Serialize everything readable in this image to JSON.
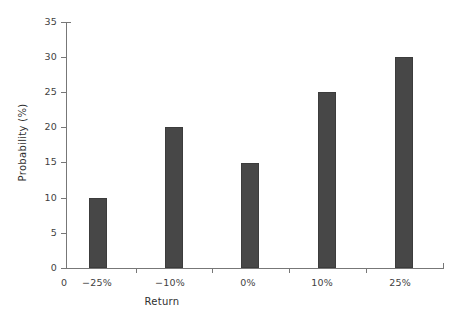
{
  "chart_data": {
    "type": "bar",
    "title": "",
    "subtitle": "",
    "xlabel": "Return",
    "ylabel": "Probability (%)",
    "categories": [
      "−25%",
      "−10%",
      "0%",
      "10%",
      "25%"
    ],
    "values": [
      10,
      20,
      15,
      25,
      30
    ],
    "series": [
      {
        "name": "Probability",
        "values": [
          10,
          20,
          15,
          25,
          30
        ]
      }
    ],
    "xlim_labels": [
      "0"
    ],
    "ylim": [
      0,
      35
    ],
    "ytick_labels": [
      "0",
      "5",
      "10",
      "15",
      "20",
      "25",
      "30",
      "35"
    ],
    "ytick_values": [
      0,
      5,
      10,
      15,
      20,
      25,
      30,
      35
    ],
    "xtick_labels": [
      "−25%",
      "−10%",
      "0%",
      "10%",
      "25%"
    ],
    "origin_label": "0",
    "grid": false,
    "legend": null,
    "legend_position": "none",
    "annotations": [],
    "colors": {
      "bar_fill": "#474747",
      "bar_stroke": "#3c3c3c",
      "axis": "#777777",
      "text": "#3f3f3f",
      "background": "#ffffff"
    }
  },
  "axes": {
    "y_title": "Probability (%)",
    "x_title": "Return"
  }
}
